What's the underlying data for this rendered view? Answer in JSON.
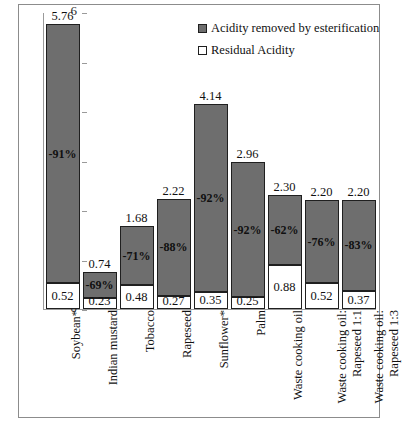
{
  "chart_data": {
    "type": "bar",
    "subtype": "stacked",
    "title": "",
    "xlabel": "",
    "ylabel": "FFA (% wt)",
    "ylim": [
      0,
      6
    ],
    "yticks": [
      0,
      1,
      2,
      3,
      4,
      5,
      6
    ],
    "ytick_labels": [
      "0",
      "1",
      "2",
      "3",
      "4",
      "5",
      "6"
    ],
    "grid": false,
    "legend_position": "top-right",
    "categories": [
      "Soybean*",
      "Indian mustard",
      "Tobacco",
      "Rapeseed",
      "Sunflower*",
      "Palm",
      "Waste cooking oil",
      "Waste cooking oil: Rapeseed 1:1",
      "Waste cooking oil: Rapeseed 1:3"
    ],
    "category_lines": [
      [
        "Soybean*"
      ],
      [
        "Indian mustard"
      ],
      [
        "Tobacco"
      ],
      [
        "Rapeseed"
      ],
      [
        "Sunflower*"
      ],
      [
        "Palm"
      ],
      [
        "Waste cooking oil"
      ],
      [
        "Waste cooking oil:",
        "Rapeseed 1:1"
      ],
      [
        "Waste cooking oil:",
        "Rapeseed 1:3"
      ]
    ],
    "series": [
      {
        "name": "Acidity removed by esterification",
        "color": "#6e6e6e",
        "values": [
          5.24,
          0.51,
          1.2,
          1.95,
          3.79,
          2.71,
          1.42,
          1.68,
          1.83
        ]
      },
      {
        "name": "Residual Acidity",
        "color": "#ffffff",
        "values": [
          0.52,
          0.23,
          0.48,
          0.27,
          0.35,
          0.25,
          0.88,
          0.52,
          0.37
        ]
      }
    ],
    "totals": [
      5.76,
      0.74,
      1.68,
      2.22,
      4.14,
      2.96,
      2.3,
      2.2,
      2.2
    ],
    "total_labels": [
      "5.76",
      "0.74",
      "1.68",
      "2.22",
      "4.14",
      "2.96",
      "2.30",
      "2.20",
      "2.20"
    ],
    "residual_labels": [
      "0.52",
      "0.23",
      "0.48",
      "0.27",
      "0.35",
      "0.25",
      "0.88",
      "0.52",
      "0.37"
    ],
    "reduction_labels": [
      "-91%",
      "-69%",
      "-71%",
      "-88%",
      "-92%",
      "-92%",
      "-62%",
      "-76%",
      "-83%"
    ],
    "annotations": [
      {
        "category": "Soybean*",
        "total": "5.76",
        "residual": "0.52",
        "reduction": "-91%"
      },
      {
        "category": "Indian mustard",
        "total": "0.74",
        "residual": "0.23",
        "reduction": "-69%"
      },
      {
        "category": "Tobacco",
        "total": "1.68",
        "residual": "0.48",
        "reduction": "-71%"
      },
      {
        "category": "Rapeseed",
        "total": "2.22",
        "residual": "0.27",
        "reduction": "-88%"
      },
      {
        "category": "Sunflower*",
        "total": "4.14",
        "residual": "0.35",
        "reduction": "-92%"
      },
      {
        "category": "Palm",
        "total": "2.96",
        "residual": "0.25",
        "reduction": "-92%"
      },
      {
        "category": "Waste cooking oil",
        "total": "2.30",
        "residual": "0.88",
        "reduction": "-62%"
      },
      {
        "category": "Waste cooking oil: Rapeseed 1:1",
        "total": "2.20",
        "residual": "0.52",
        "reduction": "-76%"
      },
      {
        "category": "Waste cooking oil: Rapeseed 1:3",
        "total": "2.20",
        "residual": "0.37",
        "reduction": "-83%"
      }
    ]
  },
  "legend": {
    "items": [
      {
        "label": "Acidity removed by esterification",
        "swatch": "filled-square-icon"
      },
      {
        "label": "Residual Acidity",
        "swatch": "open-square-icon"
      }
    ]
  },
  "colors": {
    "bar_removed": "#6e6e6e",
    "bar_residual": "#ffffff",
    "outline": "#1f1f1f",
    "axis": "#9a9a9a",
    "frame": "#8c8c8c",
    "background": "#ffffff"
  }
}
